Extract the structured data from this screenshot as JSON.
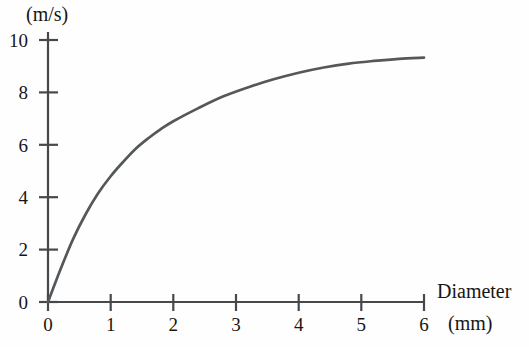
{
  "chart_data": {
    "type": "line",
    "title": "",
    "xlabel": "Diameter",
    "xunit": "(mm)",
    "ylabel": "",
    "yunit": "(m/s)",
    "xlim": [
      0,
      6
    ],
    "ylim": [
      0,
      10
    ],
    "xticks": [
      0,
      1,
      2,
      3,
      4,
      5,
      6
    ],
    "yticks": [
      0,
      2,
      4,
      6,
      8,
      10
    ],
    "xtick_labels": [
      "0",
      "1",
      "2",
      "3",
      "4",
      "5",
      "6"
    ],
    "ytick_labels": [
      "0",
      "2",
      "4",
      "6",
      "8",
      "10"
    ],
    "grid": false,
    "legend": false,
    "series": [
      {
        "name": "terminal velocity",
        "color": "#55585a",
        "x": [
          0,
          0.2,
          0.4,
          0.6,
          0.8,
          1.0,
          1.2,
          1.4,
          1.6,
          1.8,
          2.0,
          2.4,
          2.8,
          3.2,
          3.6,
          4.0,
          4.4,
          4.8,
          5.2,
          5.6,
          6.0
        ],
        "y": [
          0,
          1.25,
          2.4,
          3.35,
          4.15,
          4.8,
          5.35,
          5.85,
          6.25,
          6.6,
          6.9,
          7.4,
          7.85,
          8.2,
          8.5,
          8.75,
          8.95,
          9.1,
          9.2,
          9.28,
          9.33
        ]
      }
    ]
  },
  "axes": {
    "y_unit_text": "(m/s)",
    "x_title_text": "Diameter",
    "x_unit_text": "(mm)"
  }
}
